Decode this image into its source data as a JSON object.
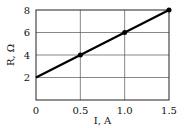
{
  "chart_data": {
    "type": "line",
    "title": "",
    "xlabel": "I, A",
    "ylabel": "R, Ω",
    "xlim": [
      0,
      1.5
    ],
    "ylim": [
      0,
      8
    ],
    "grid": true,
    "x_ticks": [
      0,
      0.5,
      1.0,
      1.5
    ],
    "x_tick_labels": [
      "0",
      "0.5",
      "1.0",
      "1.5"
    ],
    "y_ticks": [
      2,
      4,
      6,
      8
    ],
    "y_tick_labels": [
      "2",
      "4",
      "6",
      "8"
    ],
    "series": [
      {
        "name": "R vs I",
        "line": {
          "x": [
            0,
            1.5
          ],
          "y": [
            2,
            8
          ]
        },
        "points": {
          "x": [
            0.5,
            1.0,
            1.5
          ],
          "y": [
            4,
            6,
            8
          ]
        }
      }
    ]
  }
}
